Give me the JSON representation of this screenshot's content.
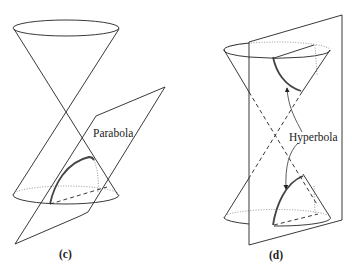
{
  "panels": [
    {
      "id": "c",
      "caption": "(c)",
      "curve_label": "Parabola"
    },
    {
      "id": "d",
      "caption": "(d)",
      "curve_label": "Hyperbola"
    }
  ]
}
